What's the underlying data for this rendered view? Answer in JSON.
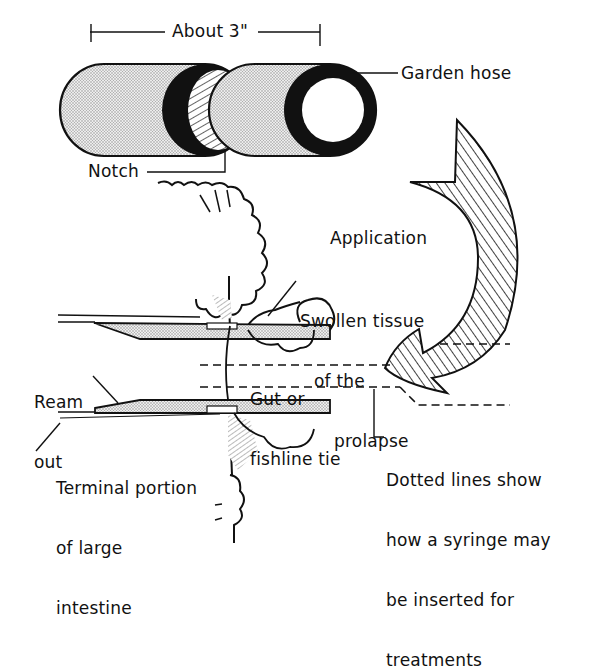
{
  "diagram": {
    "type": "anatomical-procedure-illustration",
    "colors": {
      "ink": "#111111",
      "stipple_fill": "#d6d6d6",
      "background": "#ffffff"
    },
    "labels": {
      "dimension": "About 3\"",
      "garden_hose": "Garden hose",
      "notch": "Notch",
      "application": "Application",
      "swollen_tissue": [
        "Swollen tissue",
        "of the",
        "prolapse"
      ],
      "gut_tie": [
        "Gut or",
        "fishline tie"
      ],
      "ream_out": [
        "Ream",
        "out"
      ],
      "terminal_portion": [
        "Terminal portion",
        "of large",
        "intestine"
      ],
      "dotted_lines_note": [
        "Dotted lines show",
        "how a syringe may",
        "be inserted for",
        "treatments"
      ]
    },
    "components": [
      {
        "name": "hose-section-notched",
        "description": "Cut garden hose section with notch"
      },
      {
        "name": "hose-section-end",
        "description": "Garden hose end view"
      },
      {
        "name": "application-arrow",
        "description": "Hatched curved arrow indicating application"
      },
      {
        "name": "prolapse-tissue",
        "description": "Swollen tissue of the prolapse"
      },
      {
        "name": "hose-inserted",
        "description": "Hose inserted in intestine, cross-section"
      },
      {
        "name": "tie-line",
        "description": "Gut or fishline tie"
      },
      {
        "name": "syringe-path",
        "description": "Dotted lines showing syringe insertion"
      }
    ]
  }
}
